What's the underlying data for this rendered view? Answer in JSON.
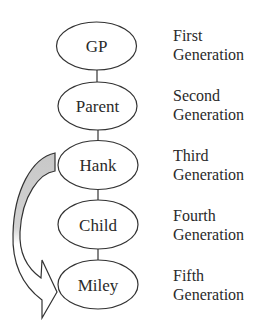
{
  "diagram": {
    "type": "generational-lineage",
    "nodes": [
      {
        "id": "gp",
        "label": "GP",
        "generation_line1": "First",
        "generation_line2": "Generation"
      },
      {
        "id": "parent",
        "label": "Parent",
        "generation_line1": "Second",
        "generation_line2": "Generation"
      },
      {
        "id": "hank",
        "label": "Hank",
        "generation_line1": "Third",
        "generation_line2": "Generation"
      },
      {
        "id": "child",
        "label": "Child",
        "generation_line1": "Fourth",
        "generation_line2": "Generation"
      },
      {
        "id": "miley",
        "label": "Miley",
        "generation_line1": "Fifth",
        "generation_line2": "Generation"
      }
    ],
    "edges": [
      {
        "from": "gp",
        "to": "parent"
      },
      {
        "from": "parent",
        "to": "hank"
      },
      {
        "from": "hank",
        "to": "child"
      },
      {
        "from": "child",
        "to": "miley"
      }
    ],
    "arrow": {
      "from": "hank",
      "to": "miley",
      "shape": "curved-block-arrow",
      "fill_top": "#cfcfcf",
      "fill_bottom": "#ffffff",
      "stroke": "#333333"
    },
    "colors": {
      "stroke": "#333333",
      "node_fill": "#ffffff",
      "text": "#2a2a2a"
    }
  }
}
